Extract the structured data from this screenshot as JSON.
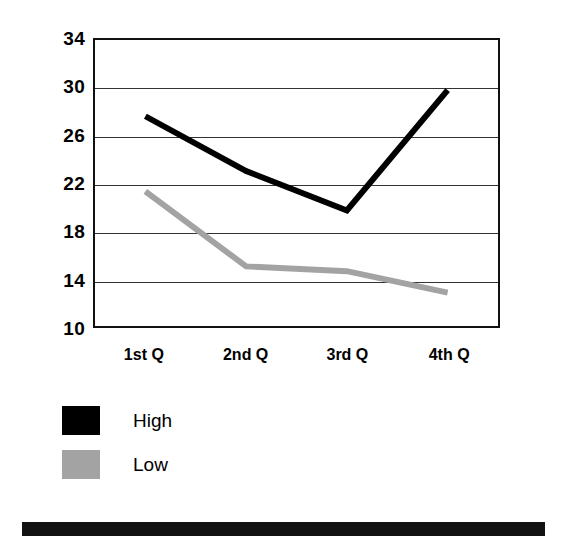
{
  "chart_data": {
    "type": "line",
    "title": "",
    "subtitle": "",
    "xlabel": "",
    "ylabel": "",
    "categories": [
      "1st Q",
      "2nd Q",
      "3rd Q",
      "4th Q"
    ],
    "series": [
      {
        "name": "High",
        "color": "#000000",
        "values": [
          27.6,
          23.0,
          19.7,
          29.8
        ]
      },
      {
        "name": "Low",
        "color": "#a3a3a3",
        "values": [
          21.3,
          15.0,
          14.6,
          12.8
        ]
      }
    ],
    "ylim": [
      10,
      34
    ],
    "ytick_step": 4,
    "yticks": [
      34,
      30,
      26,
      22,
      18,
      14,
      10
    ],
    "ytick_labels": [
      "34",
      "30",
      "26",
      "22",
      "18",
      "14",
      "10"
    ],
    "grid": true,
    "grid_axis": "y",
    "legend": {
      "position": "below-left",
      "entries": [
        {
          "label": "High",
          "color": "#000000"
        },
        {
          "label": "Low",
          "color": "#a3a3a3"
        }
      ]
    },
    "frame": true,
    "markers": false
  },
  "footer": {
    "bar_color": "#121212"
  }
}
